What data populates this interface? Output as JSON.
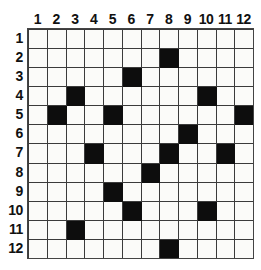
{
  "grid": {
    "rows": 12,
    "columns": 12,
    "column_headers": [
      "1",
      "2",
      "3",
      "4",
      "5",
      "6",
      "7",
      "8",
      "9",
      "10",
      "11",
      "12"
    ],
    "row_headers": [
      "1",
      "2",
      "3",
      "4",
      "5",
      "6",
      "7",
      "8",
      "9",
      "10",
      "11",
      "12"
    ],
    "colors": {
      "filled_cell": "#0d0d0d",
      "empty_cell": "#fbfbf9",
      "gridline": "#3b3b3b",
      "frame": "#444444",
      "label_text": "#111111",
      "background": "#ffffff"
    },
    "filled_cells": [
      {
        "row": 2,
        "columns": [
          8
        ]
      },
      {
        "row": 3,
        "columns": [
          6
        ]
      },
      {
        "row": 4,
        "columns": [
          3,
          10
        ]
      },
      {
        "row": 5,
        "columns": [
          2,
          5,
          12
        ]
      },
      {
        "row": 6,
        "columns": [
          9
        ]
      },
      {
        "row": 7,
        "columns": [
          4,
          8,
          11
        ]
      },
      {
        "row": 8,
        "columns": [
          7
        ]
      },
      {
        "row": 9,
        "columns": [
          5
        ]
      },
      {
        "row": 10,
        "columns": [
          6,
          10
        ]
      },
      {
        "row": 11,
        "columns": [
          3
        ]
      },
      {
        "row": 12,
        "columns": [
          8
        ]
      }
    ],
    "cell_matrix": [
      [
        0,
        0,
        0,
        0,
        0,
        0,
        0,
        0,
        0,
        0,
        0,
        0
      ],
      [
        0,
        0,
        0,
        0,
        0,
        0,
        0,
        1,
        0,
        0,
        0,
        0
      ],
      [
        0,
        0,
        0,
        0,
        0,
        1,
        0,
        0,
        0,
        0,
        0,
        0
      ],
      [
        0,
        0,
        1,
        0,
        0,
        0,
        0,
        0,
        0,
        1,
        0,
        0
      ],
      [
        0,
        1,
        0,
        0,
        1,
        0,
        0,
        0,
        0,
        0,
        0,
        1
      ],
      [
        0,
        0,
        0,
        0,
        0,
        0,
        0,
        0,
        1,
        0,
        0,
        0
      ],
      [
        0,
        0,
        0,
        1,
        0,
        0,
        0,
        1,
        0,
        0,
        1,
        0
      ],
      [
        0,
        0,
        0,
        0,
        0,
        0,
        1,
        0,
        0,
        0,
        0,
        0
      ],
      [
        0,
        0,
        0,
        0,
        1,
        0,
        0,
        0,
        0,
        0,
        0,
        0
      ],
      [
        0,
        0,
        0,
        0,
        0,
        1,
        0,
        0,
        0,
        1,
        0,
        0
      ],
      [
        0,
        0,
        1,
        0,
        0,
        0,
        0,
        0,
        0,
        0,
        0,
        0
      ],
      [
        0,
        0,
        0,
        0,
        0,
        0,
        0,
        1,
        0,
        0,
        0,
        0
      ]
    ],
    "filled_count": 16
  }
}
